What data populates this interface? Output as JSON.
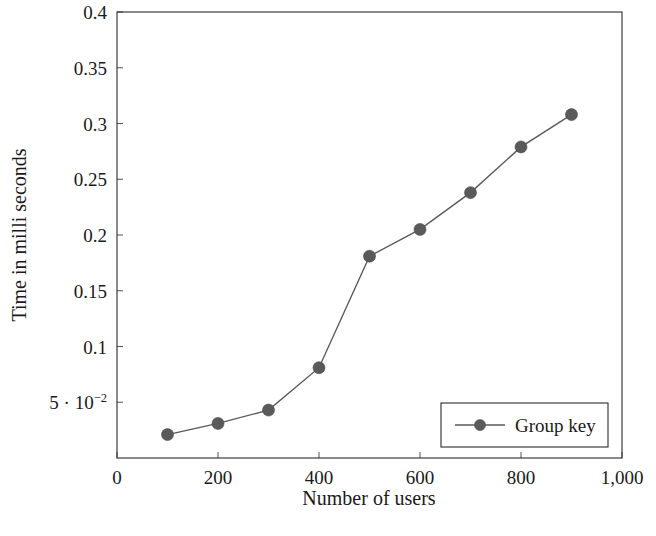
{
  "chart_data": {
    "type": "line",
    "title": "",
    "xlabel": "Number of users",
    "ylabel": "Time in milli seconds",
    "xlim": [
      0,
      1000
    ],
    "ylim": [
      0,
      0.4
    ],
    "grid": false,
    "legend_position": "lower right",
    "x": [
      100,
      200,
      300,
      400,
      500,
      600,
      700,
      800,
      900
    ],
    "series": [
      {
        "name": "Group key",
        "values": [
          0.021,
          0.031,
          0.043,
          0.081,
          0.181,
          0.205,
          0.238,
          0.279,
          0.308
        ],
        "color": "#5a5a5a",
        "marker": "circle"
      }
    ],
    "x_ticks": [
      {
        "value": 0,
        "label": "0"
      },
      {
        "value": 200,
        "label": "200"
      },
      {
        "value": 400,
        "label": "400"
      },
      {
        "value": 600,
        "label": "600"
      },
      {
        "value": 800,
        "label": "800"
      },
      {
        "value": 1000,
        "label": "1,000"
      }
    ],
    "y_ticks": [
      {
        "value": 0.05,
        "label": "5 · 10",
        "sup": "−2"
      },
      {
        "value": 0.1,
        "label": "0.1",
        "sup": ""
      },
      {
        "value": 0.15,
        "label": "0.15",
        "sup": ""
      },
      {
        "value": 0.2,
        "label": "0.2",
        "sup": ""
      },
      {
        "value": 0.25,
        "label": "0.25",
        "sup": ""
      },
      {
        "value": 0.3,
        "label": "0.3",
        "sup": ""
      },
      {
        "value": 0.35,
        "label": "0.35",
        "sup": ""
      },
      {
        "value": 0.4,
        "label": "0.4",
        "sup": ""
      }
    ]
  },
  "legend": {
    "entries": [
      {
        "label": "Group key"
      }
    ]
  },
  "colors": {
    "series": "#5a5a5a",
    "axis": "#2b2b2b",
    "text": "#1a1a1a",
    "background": "#ffffff"
  }
}
